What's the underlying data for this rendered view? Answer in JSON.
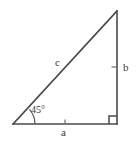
{
  "figure": {
    "background_color": "#ffffff",
    "stroke_color": "#4a4a4a",
    "text_color": "#3a3a3a"
  },
  "labels": {
    "side_a": "a",
    "side_b": "b",
    "side_c": "c",
    "angle": "45°"
  },
  "geometry": {
    "vertex_left": "13,124",
    "vertex_bottom_right": "117,124",
    "vertex_apex": "117,11",
    "right_angle_marker_size": "8",
    "angle_arc_radius": "22"
  },
  "icons": {
    "right_angle": "right-angle-marker",
    "angle_arc": "angle-arc",
    "tick_a": "tick-mark",
    "tick_b": "tick-mark"
  }
}
